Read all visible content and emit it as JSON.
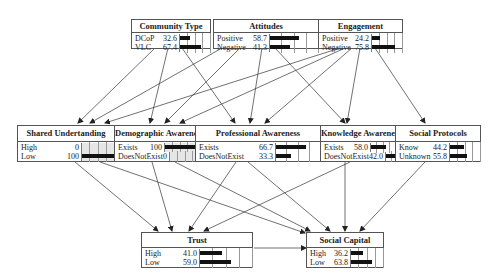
{
  "nodes": {
    "community_type": {
      "title": "Community Type",
      "states": [
        {
          "label": "DCoP",
          "value": "32.6",
          "pct": 32.6
        },
        {
          "label": "VLC",
          "value": "67.4",
          "pct": 67.4
        }
      ]
    },
    "attitudes": {
      "title": "Attitudes",
      "states": [
        {
          "label": "Positive",
          "value": "58.7",
          "pct": 58.7
        },
        {
          "label": "Negative",
          "value": "41.3",
          "pct": 41.3
        }
      ]
    },
    "engagement": {
      "title": "Engagement",
      "states": [
        {
          "label": "Positive",
          "value": "24.2",
          "pct": 24.2
        },
        {
          "label": "Negative",
          "value": "75.8",
          "pct": 75.8
        }
      ]
    },
    "shared_understanding": {
      "title": "Shared Undertanding",
      "states": [
        {
          "label": "High",
          "value": "0",
          "pct": 0
        },
        {
          "label": "Low",
          "value": "100",
          "pct": 100
        }
      ]
    },
    "demographic_awareness": {
      "title": "Demographic Awareness",
      "states": [
        {
          "label": "Exists",
          "value": "100",
          "pct": 100
        },
        {
          "label": "DoesNotExist",
          "value": "0",
          "pct": 0
        }
      ]
    },
    "professional_awareness": {
      "title": "Professional Awareness",
      "states": [
        {
          "label": "Exists",
          "value": "66.7",
          "pct": 66.7
        },
        {
          "label": "DoesNotExist",
          "value": "33.3",
          "pct": 33.3
        }
      ]
    },
    "knowledge_awareness": {
      "title": "Knowledge Awareness",
      "states": [
        {
          "label": "Exists",
          "value": "58.0",
          "pct": 58.0
        },
        {
          "label": "DoesNotExist",
          "value": "42.0",
          "pct": 42.0
        }
      ]
    },
    "social_protocols": {
      "title": "Social Protocols",
      "states": [
        {
          "label": "Know",
          "value": "44.2",
          "pct": 44.2
        },
        {
          "label": "Unknown",
          "value": "55.8",
          "pct": 55.8
        }
      ]
    },
    "trust": {
      "title": "Trust",
      "states": [
        {
          "label": "High",
          "value": "41.0",
          "pct": 41.0
        },
        {
          "label": "Low",
          "value": "59.0",
          "pct": 59.0
        }
      ]
    },
    "social_capital": {
      "title": "Social Capital",
      "states": [
        {
          "label": "High",
          "value": "36.2",
          "pct": 36.2
        },
        {
          "label": "Low",
          "value": "63.8",
          "pct": 63.8
        }
      ]
    }
  },
  "colors": {
    "border": "#555555",
    "bar": "#111111",
    "edge": "#333333",
    "evidence_bg": "#e6e6e6"
  }
}
